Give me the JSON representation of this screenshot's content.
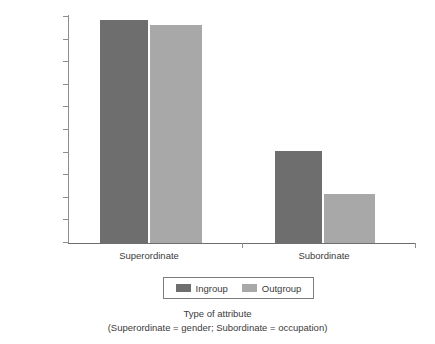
{
  "chart_data": {
    "type": "bar",
    "title": "",
    "categories": [
      "Superordinate",
      "Subordinate"
    ],
    "series": [
      {
        "name": "Ingroup",
        "color": "#6e6e6e",
        "values": [
          0.985,
          0.405
        ]
      },
      {
        "name": "Outgroup",
        "color": "#a8a8a8",
        "values": [
          0.965,
          0.215
        ]
      }
    ],
    "ylabel": "Recall of target attribute",
    "xlabel": "Type of attribute",
    "xlabel_note": "(Superordinate = gender; Subordinate = occupation)",
    "ylim": [
      0,
      1
    ],
    "ytick_labels": [
      "1",
      "0.9",
      "0.8",
      "0.7",
      "0.6",
      "0.5",
      "0.4",
      "0.3",
      "0.2",
      "0.1",
      "0"
    ],
    "ytick_values": [
      1,
      0.9,
      0.8,
      0.7,
      0.6,
      0.5,
      0.4,
      0.3,
      0.2,
      0.1,
      0
    ],
    "grid": false,
    "legend_position": "bottom-center"
  },
  "axes": {
    "y_title": "Recall of target attribute",
    "x_title_line1": "Type of attribute",
    "x_title_line2": "(Superordinate = gender; Subordinate = occupation)"
  },
  "legend": {
    "entries": [
      {
        "label": "Ingroup"
      },
      {
        "label": "Outgroup"
      }
    ]
  }
}
